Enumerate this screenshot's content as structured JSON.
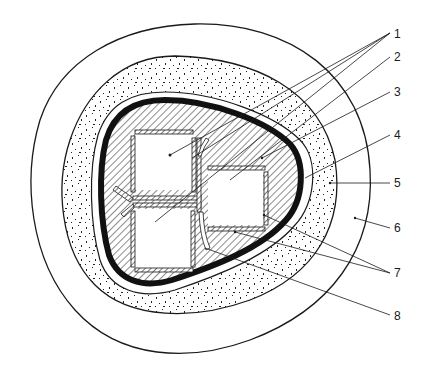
{
  "diagram": {
    "type": "cross-section",
    "colors": {
      "ink": "#1a1a1a",
      "background": "#ffffff"
    },
    "callouts": [
      {
        "id": "1",
        "label": "1"
      },
      {
        "id": "2",
        "label": "2"
      },
      {
        "id": "3",
        "label": "3"
      },
      {
        "id": "4",
        "label": "4"
      },
      {
        "id": "5",
        "label": "5"
      },
      {
        "id": "6",
        "label": "6"
      },
      {
        "id": "7",
        "label": "7"
      },
      {
        "id": "8",
        "label": "8"
      }
    ],
    "layers": [
      {
        "name": "outer-ring",
        "fill": "plain"
      },
      {
        "name": "stippled-ring",
        "fill": "dotted"
      },
      {
        "name": "thin-gap-ring",
        "fill": "plain"
      },
      {
        "name": "thick-black-wall",
        "fill": "solid"
      },
      {
        "name": "hatched-core",
        "fill": "diagonal-hatch"
      },
      {
        "name": "square-voids",
        "count": 3
      }
    ]
  }
}
